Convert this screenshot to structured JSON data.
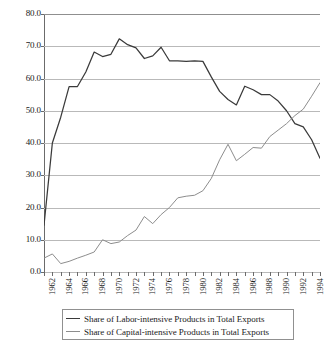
{
  "chart_data": {
    "type": "line",
    "title": "",
    "xlabel": "",
    "ylabel": "",
    "xlim": [
      1962,
      1995
    ],
    "ylim": [
      0.0,
      80.0
    ],
    "grid": true,
    "legend_position": "bottom",
    "y_ticks": [
      "0.0",
      "10.0",
      "20.0",
      "30.0",
      "40.0",
      "50.0",
      "60.0",
      "70.0",
      "80.0"
    ],
    "x_tick_labels": [
      "1962",
      "1964",
      "1966",
      "1968",
      "1970",
      "1972",
      "1974",
      "1976",
      "1978",
      "1980",
      "1982",
      "1984",
      "1986",
      "1988",
      "1990",
      "1992",
      "1994"
    ],
    "x": [
      1962,
      1963,
      1964,
      1965,
      1966,
      1967,
      1968,
      1969,
      1970,
      1971,
      1972,
      1973,
      1974,
      1975,
      1976,
      1977,
      1978,
      1979,
      1980,
      1981,
      1982,
      1983,
      1984,
      1985,
      1986,
      1987,
      1988,
      1989,
      1990,
      1991,
      1992,
      1993,
      1994,
      1995
    ],
    "series": [
      {
        "name": "Share of Labor-intensive Products in Total Exports",
        "color": "#3a3a3a",
        "values": [
          14.5,
          40.0,
          48.0,
          57.5,
          57.5,
          62.0,
          68.2,
          66.8,
          67.5,
          72.3,
          70.5,
          69.5,
          66.2,
          67.0,
          69.7,
          65.5,
          65.5,
          65.3,
          65.5,
          65.3,
          60.5,
          56.0,
          53.5,
          51.8,
          57.6,
          56.5,
          55.0,
          55.0,
          53.0,
          50.0,
          46.0,
          45.0,
          41.0,
          35.3
        ]
      },
      {
        "name": "Share of Capital-intensive Products in Total Exports",
        "color": "#8d8d8d",
        "values": [
          4.3,
          5.6,
          2.6,
          3.3,
          4.3,
          5.2,
          6.2,
          10.0,
          8.8,
          9.3,
          11.3,
          13.0,
          17.2,
          15.0,
          17.8,
          20.0,
          23.0,
          23.5,
          23.8,
          25.2,
          29.0,
          34.8,
          39.6,
          34.5,
          36.5,
          38.6,
          38.4,
          42.0,
          44.0,
          46.0,
          48.5,
          50.5,
          54.5,
          58.7
        ]
      }
    ]
  },
  "legend": {
    "items": [
      {
        "label": "Share of Labor-intensive Products in Total Exports",
        "color": "#3a3a3a"
      },
      {
        "label": "Share of Capital-intensive Products in Total Exports",
        "color": "#8d8d8d"
      }
    ]
  }
}
